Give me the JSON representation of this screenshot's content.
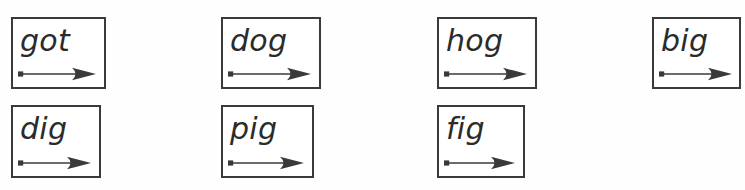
{
  "worksheet": {
    "background_color": "#fefefe",
    "border_color": "#3a3a3a",
    "text_color": "#2b2b2b",
    "columns": 4,
    "rows": 2,
    "card_count": 7
  },
  "cards": [
    {
      "word": "got",
      "row": 1,
      "column": 1,
      "x": 11,
      "y": 17,
      "width": 95,
      "height": 72,
      "arrow_width": 78,
      "icon": "blend-arrow-icon"
    },
    {
      "word": "dog",
      "row": 1,
      "column": 2,
      "x": 221,
      "y": 17,
      "width": 100,
      "height": 72,
      "arrow_width": 83,
      "icon": "blend-arrow-icon"
    },
    {
      "word": "hog",
      "row": 1,
      "column": 3,
      "x": 437,
      "y": 17,
      "width": 100,
      "height": 72,
      "arrow_width": 83,
      "icon": "blend-arrow-icon"
    },
    {
      "word": "big",
      "row": 1,
      "column": 4,
      "x": 652,
      "y": 17,
      "width": 89,
      "height": 72,
      "arrow_width": 73,
      "icon": "blend-arrow-icon"
    },
    {
      "word": "dig",
      "row": 2,
      "column": 1,
      "x": 11,
      "y": 105,
      "width": 90,
      "height": 73,
      "arrow_width": 73,
      "icon": "blend-arrow-icon"
    },
    {
      "word": "pig",
      "row": 2,
      "column": 2,
      "x": 221,
      "y": 105,
      "width": 93,
      "height": 73,
      "arrow_width": 76,
      "icon": "blend-arrow-icon"
    },
    {
      "word": "fig",
      "row": 2,
      "column": 3,
      "x": 437,
      "y": 105,
      "width": 88,
      "height": 73,
      "arrow_width": 71,
      "icon": "blend-arrow-icon"
    }
  ]
}
